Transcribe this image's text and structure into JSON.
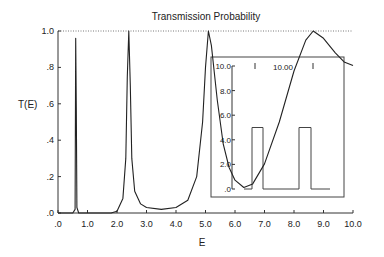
{
  "chart_data": {
    "type": "line",
    "title": "Transmission Probability",
    "xlabel": "E",
    "ylabel": "T(E)",
    "xlim": [
      0,
      10
    ],
    "ylim": [
      0,
      1
    ],
    "x_ticks": [
      ".0",
      "1.0",
      "2.0",
      "3.0",
      "4.0",
      "5.0",
      "6.0",
      "7.0",
      "8.0",
      "9.0",
      "10.0"
    ],
    "y_ticks": [
      ".0",
      ".2",
      ".4",
      ".6",
      ".8",
      "1.0"
    ],
    "reference_line": {
      "y": 1.0,
      "style": "dotted"
    },
    "series": [
      {
        "name": "T(E)",
        "points": [
          [
            0.0,
            0.0
          ],
          [
            0.5,
            0.0
          ],
          [
            0.58,
            0.02
          ],
          [
            0.6,
            0.96
          ],
          [
            0.62,
            0.58
          ],
          [
            0.64,
            0.03
          ],
          [
            0.7,
            0.0
          ],
          [
            1.8,
            0.0
          ],
          [
            2.0,
            0.01
          ],
          [
            2.2,
            0.08
          ],
          [
            2.3,
            0.3
          ],
          [
            2.35,
            0.75
          ],
          [
            2.4,
            1.0
          ],
          [
            2.45,
            0.7
          ],
          [
            2.5,
            0.3
          ],
          [
            2.6,
            0.12
          ],
          [
            2.8,
            0.05
          ],
          [
            3.0,
            0.03
          ],
          [
            3.5,
            0.02
          ],
          [
            4.0,
            0.03
          ],
          [
            4.4,
            0.07
          ],
          [
            4.7,
            0.2
          ],
          [
            4.9,
            0.5
          ],
          [
            5.0,
            0.8
          ],
          [
            5.1,
            1.0
          ],
          [
            5.2,
            0.92
          ],
          [
            5.4,
            0.62
          ],
          [
            5.6,
            0.38
          ],
          [
            5.8,
            0.25
          ],
          [
            6.0,
            0.18
          ],
          [
            6.3,
            0.14
          ],
          [
            6.6,
            0.16
          ],
          [
            7.0,
            0.27
          ],
          [
            7.5,
            0.5
          ],
          [
            8.0,
            0.78
          ],
          [
            8.4,
            0.95
          ],
          [
            8.65,
            1.0
          ],
          [
            9.0,
            0.96
          ],
          [
            9.4,
            0.88
          ],
          [
            9.7,
            0.83
          ],
          [
            10.0,
            0.81
          ]
        ]
      }
    ],
    "inset": {
      "label": "10.00",
      "y_ticks": [
        ".0",
        "2.0",
        "4.0",
        "6.0",
        "8.0",
        "10.0"
      ],
      "barriers": [
        {
          "x_start": 0.2,
          "x_end": 0.3,
          "height": 5.0
        },
        {
          "x_start": 0.7,
          "x_end": 0.8,
          "height": 5.0
        }
      ]
    }
  }
}
